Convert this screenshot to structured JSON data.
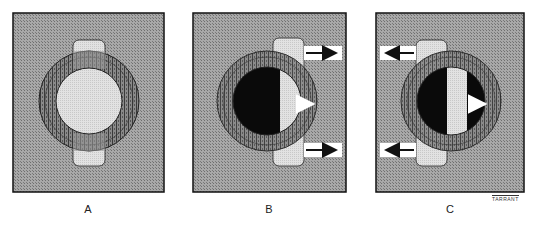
{
  "figure": {
    "panels": [
      {
        "id": "A",
        "label": "A",
        "state": "aligned",
        "arrows": []
      },
      {
        "id": "B",
        "label": "B",
        "state": "shifted-right",
        "arrows": [
          "right",
          "right",
          "right-inner"
        ]
      },
      {
        "id": "C",
        "label": "C",
        "state": "shifted-left",
        "arrows": [
          "left",
          "left",
          "right-inner"
        ]
      }
    ],
    "signature": "TARRANT",
    "colors": {
      "background_hatch": "#9a9a9a",
      "ring": "#6a6a6a",
      "bar": "#dedede",
      "pupil_light": "#e4e4e4",
      "pupil_dark": "#0a0a0a",
      "outline": "#111111"
    }
  }
}
